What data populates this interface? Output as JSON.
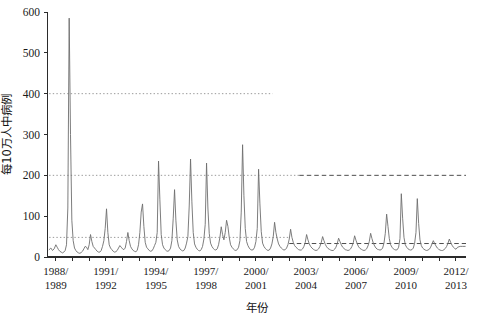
{
  "chart_data": {
    "type": "line",
    "title": "",
    "xlabel": "年份",
    "ylabel": "每10万人中病例",
    "ylim": [
      0,
      600
    ],
    "yticks": [
      0,
      100,
      200,
      300,
      400,
      500,
      600
    ],
    "ytick_labels": [
      "0",
      "100",
      "200",
      "300",
      "400",
      "500",
      "600"
    ],
    "grid": false,
    "legend": null,
    "xlim": [
      1988.5,
      2013.6
    ],
    "xtick_labels": [
      "1988/\n1989",
      "1991/\n1992",
      "1994/\n1995",
      "1997/\n1998",
      "2000/\n2001",
      "2003/\n2004",
      "2006/\n2007",
      "2009/\n2010",
      "2012/\n2013"
    ],
    "xtick_values": [
      1989,
      1992,
      1995,
      1998,
      2001,
      2004,
      2007,
      2010,
      2013
    ],
    "xtick_lines": [
      [
        "1988/",
        "1989"
      ],
      [
        "1991/",
        "1992"
      ],
      [
        "1994/",
        "1995"
      ],
      [
        "1997/",
        "1998"
      ],
      [
        "2000/",
        "2001"
      ],
      [
        "2003/",
        "2004"
      ],
      [
        "2006/",
        "2007"
      ],
      [
        "2009/",
        "2010"
      ],
      [
        "2012/",
        "2013"
      ]
    ],
    "minor_xticks": [
      1989,
      1990,
      1991,
      1992,
      1993,
      1994,
      1995,
      1996,
      1997,
      1998,
      1999,
      2000,
      2001,
      2002,
      2003,
      2004,
      2005,
      2006,
      2007,
      2008,
      2009,
      2010,
      2011,
      2012,
      2013
    ],
    "reference_lines": [
      {
        "name": "threshold-400-dotted",
        "y": 400,
        "style": "dotted",
        "color": "#9a9a9a",
        "x_start": 1988.6,
        "x_end": 2002.0
      },
      {
        "name": "threshold-200-dotted",
        "y": 200,
        "style": "dotted",
        "color": "#9a9a9a",
        "x_start": 1988.6,
        "x_end": 2003.6
      },
      {
        "name": "threshold-200-dashed",
        "y": 200,
        "style": "dashed",
        "color": "#4d4d4d",
        "x_start": 2003.6,
        "x_end": 2013.6
      },
      {
        "name": "baseline-48-dotted",
        "y": 48,
        "style": "dotted",
        "color": "#9a9a9a",
        "x_start": 1988.6,
        "x_end": 2003.0
      },
      {
        "name": "baseline-33-dashed",
        "y": 33,
        "style": "dashed",
        "color": "#4d4d4d",
        "x_start": 2003.0,
        "x_end": 2013.6
      }
    ],
    "series": [
      {
        "name": "每10万人中病例",
        "color": "#6e6e6e",
        "x": [
          1988.6,
          1988.7,
          1988.8,
          1988.9,
          1989.0,
          1989.08,
          1989.16,
          1989.24,
          1989.32,
          1989.4,
          1989.48,
          1989.56,
          1989.64,
          1989.72,
          1989.8,
          1989.88,
          1989.96,
          1990.04,
          1990.12,
          1990.2,
          1990.28,
          1990.36,
          1990.44,
          1990.52,
          1990.6,
          1990.68,
          1990.76,
          1990.84,
          1990.92,
          1991.0,
          1991.08,
          1991.16,
          1991.24,
          1991.32,
          1991.4,
          1991.48,
          1991.56,
          1991.64,
          1991.72,
          1991.8,
          1991.88,
          1991.96,
          1992.04,
          1992.12,
          1992.2,
          1992.28,
          1992.36,
          1992.44,
          1992.52,
          1992.6,
          1992.68,
          1992.76,
          1992.84,
          1992.92,
          1993.0,
          1993.08,
          1993.16,
          1993.24,
          1993.32,
          1993.4,
          1993.48,
          1993.56,
          1993.64,
          1993.72,
          1993.8,
          1993.88,
          1993.96,
          1994.04,
          1994.12,
          1994.2,
          1994.28,
          1994.36,
          1994.44,
          1994.52,
          1994.6,
          1994.68,
          1994.76,
          1994.84,
          1994.92,
          1995.0,
          1995.08,
          1995.16,
          1995.24,
          1995.32,
          1995.4,
          1995.48,
          1995.56,
          1995.64,
          1995.72,
          1995.8,
          1995.88,
          1995.96,
          1996.04,
          1996.12,
          1996.2,
          1996.28,
          1996.36,
          1996.44,
          1996.52,
          1996.6,
          1996.68,
          1996.76,
          1996.84,
          1996.92,
          1997.0,
          1997.08,
          1997.16,
          1997.24,
          1997.32,
          1997.4,
          1997.48,
          1997.56,
          1997.64,
          1997.72,
          1997.8,
          1997.88,
          1997.96,
          1998.04,
          1998.12,
          1998.2,
          1998.28,
          1998.36,
          1998.44,
          1998.52,
          1998.6,
          1998.68,
          1998.76,
          1998.84,
          1998.92,
          1999.0,
          1999.08,
          1999.16,
          1999.24,
          1999.32,
          1999.4,
          1999.48,
          1999.56,
          1999.64,
          1999.72,
          1999.8,
          1999.88,
          1999.96,
          2000.04,
          2000.12,
          2000.2,
          2000.28,
          2000.36,
          2000.44,
          2000.52,
          2000.6,
          2000.68,
          2000.76,
          2000.84,
          2000.92,
          2001.0,
          2001.08,
          2001.16,
          2001.24,
          2001.32,
          2001.4,
          2001.48,
          2001.56,
          2001.64,
          2001.72,
          2001.8,
          2001.88,
          2001.96,
          2002.04,
          2002.12,
          2002.2,
          2002.28,
          2002.36,
          2002.44,
          2002.52,
          2002.6,
          2002.68,
          2002.76,
          2002.84,
          2002.92,
          2003.0,
          2003.08,
          2003.16,
          2003.24,
          2003.32,
          2003.4,
          2003.48,
          2003.56,
          2003.64,
          2003.72,
          2003.8,
          2003.88,
          2003.96,
          2004.04,
          2004.12,
          2004.2,
          2004.28,
          2004.36,
          2004.44,
          2004.52,
          2004.6,
          2004.68,
          2004.76,
          2004.84,
          2004.92,
          2005.0,
          2005.08,
          2005.16,
          2005.24,
          2005.32,
          2005.4,
          2005.48,
          2005.56,
          2005.64,
          2005.72,
          2005.8,
          2005.88,
          2005.96,
          2006.04,
          2006.12,
          2006.2,
          2006.28,
          2006.36,
          2006.44,
          2006.52,
          2006.6,
          2006.68,
          2006.76,
          2006.84,
          2006.92,
          2007.0,
          2007.08,
          2007.16,
          2007.24,
          2007.32,
          2007.4,
          2007.48,
          2007.56,
          2007.64,
          2007.72,
          2007.8,
          2007.88,
          2007.96,
          2008.04,
          2008.12,
          2008.2,
          2008.28,
          2008.36,
          2008.44,
          2008.52,
          2008.6,
          2008.68,
          2008.76,
          2008.84,
          2008.92,
          2009.0,
          2009.08,
          2009.16,
          2009.24,
          2009.32,
          2009.4,
          2009.48,
          2009.56,
          2009.64,
          2009.72,
          2009.8,
          2009.88,
          2009.96,
          2010.04,
          2010.12,
          2010.2,
          2010.28,
          2010.36,
          2010.44,
          2010.52,
          2010.6,
          2010.68,
          2010.76,
          2010.84,
          2010.92,
          2011.0,
          2011.08,
          2011.16,
          2011.24,
          2011.32,
          2011.4,
          2011.48,
          2011.56,
          2011.64,
          2011.72,
          2011.8,
          2011.88,
          2011.96,
          2012.04,
          2012.12,
          2012.2,
          2012.28,
          2012.36,
          2012.44,
          2012.52,
          2012.6,
          2012.68,
          2012.76,
          2012.84,
          2012.92,
          2013.0,
          2013.1,
          2013.25,
          2013.4,
          2013.55
        ],
        "y": [
          18,
          22,
          16,
          20,
          30,
          24,
          18,
          14,
          12,
          10,
          12,
          16,
          30,
          120,
          585,
          300,
          90,
          40,
          22,
          16,
          12,
          10,
          9,
          11,
          14,
          20,
          26,
          24,
          18,
          30,
          55,
          38,
          26,
          22,
          18,
          14,
          12,
          12,
          16,
          26,
          40,
          70,
          118,
          60,
          30,
          22,
          18,
          14,
          12,
          13,
          16,
          22,
          28,
          24,
          20,
          18,
          22,
          38,
          60,
          40,
          26,
          20,
          16,
          14,
          13,
          16,
          30,
          60,
          110,
          130,
          75,
          36,
          24,
          20,
          16,
          14,
          15,
          20,
          28,
          36,
          60,
          235,
          140,
          55,
          30,
          22,
          18,
          15,
          14,
          16,
          22,
          40,
          95,
          165,
          90,
          42,
          26,
          20,
          17,
          15,
          16,
          22,
          34,
          50,
          125,
          240,
          135,
          60,
          32,
          24,
          19,
          16,
          15,
          18,
          26,
          44,
          80,
          230,
          120,
          58,
          34,
          26,
          21,
          18,
          17,
          20,
          30,
          48,
          74,
          55,
          42,
          60,
          90,
          75,
          48,
          30,
          24,
          20,
          17,
          16,
          18,
          24,
          40,
          110,
          275,
          150,
          70,
          38,
          28,
          22,
          18,
          17,
          18,
          24,
          38,
          70,
          215,
          130,
          62,
          34,
          26,
          21,
          18,
          16,
          17,
          22,
          32,
          50,
          85,
          60,
          44,
          32,
          26,
          22,
          19,
          17,
          18,
          22,
          30,
          44,
          68,
          48,
          36,
          28,
          24,
          21,
          18,
          17,
          17,
          20,
          26,
          36,
          55,
          42,
          32,
          26,
          22,
          19,
          17,
          16,
          17,
          20,
          26,
          36,
          50,
          40,
          31,
          25,
          21,
          19,
          17,
          16,
          16,
          19,
          24,
          33,
          46,
          38,
          30,
          24,
          21,
          18,
          17,
          16,
          17,
          20,
          26,
          35,
          52,
          41,
          32,
          25,
          21,
          19,
          17,
          16,
          17,
          20,
          27,
          38,
          58,
          45,
          34,
          27,
          22,
          19,
          18,
          17,
          18,
          22,
          34,
          58,
          105,
          75,
          45,
          30,
          24,
          20,
          18,
          17,
          18,
          24,
          45,
          155,
          95,
          48,
          30,
          24,
          20,
          18,
          17,
          18,
          22,
          34,
          60,
          143,
          82,
          42,
          28,
          22,
          19,
          17,
          16,
          17,
          19,
          24,
          32,
          40,
          33,
          27,
          22,
          19,
          17,
          16,
          16,
          18,
          21,
          26,
          34,
          44,
          36,
          29,
          24,
          21,
          19,
          24,
          26,
          26,
          26
        ]
      }
    ]
  },
  "axes": {
    "y_axis_label": "每10万人中病例",
    "x_axis_label": "年份"
  }
}
